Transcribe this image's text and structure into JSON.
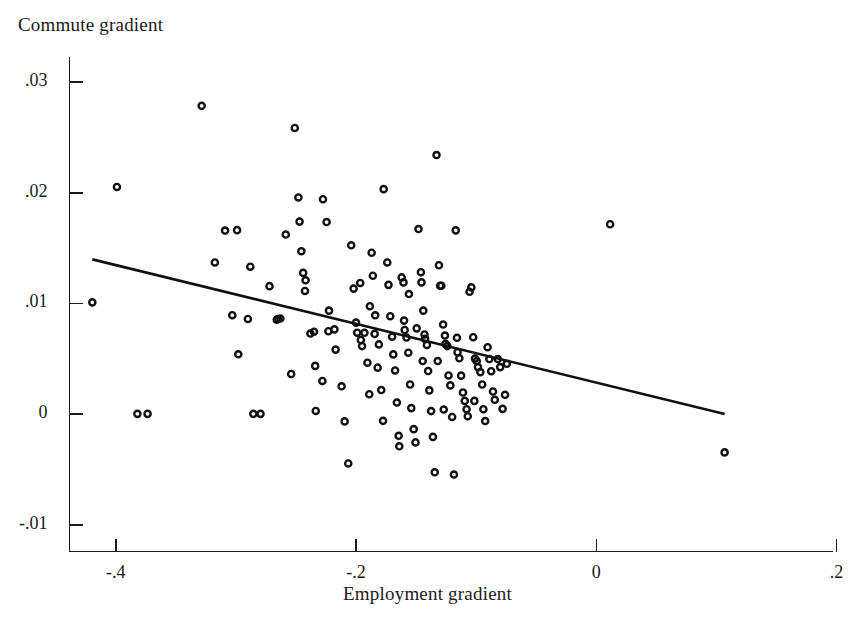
{
  "chart_data": {
    "type": "scatter",
    "title": "",
    "xlabel": "Employment gradient",
    "ylabel": "Commute gradient",
    "grid": false,
    "legend": null,
    "xlim": [
      -0.4385,
      0.1966
    ],
    "ylim": [
      -0.0124,
      0.0323
    ],
    "xticks": [
      -0.4,
      -0.2,
      0,
      0.2
    ],
    "xtick_labels": [
      "-.4",
      "-.2",
      "0",
      ".2"
    ],
    "yticks": [
      -0.01,
      0,
      0.01,
      0.02,
      0.03
    ],
    "ytick_labels": [
      "-.01",
      "0",
      ".01",
      ".02",
      ".03"
    ],
    "marker": "open-circle",
    "marker_color": "#101010",
    "fit_line": {
      "type": "linear",
      "color": "#101010",
      "x_start": -0.4195,
      "y_start": 0.01398,
      "x_end": 0.1068,
      "y_end": 2e-05
    },
    "points": [
      [
        -0.4195,
        0.0101
      ],
      [
        -0.399,
        0.02052
      ],
      [
        -0.382,
        3e-05
      ],
      [
        -0.3735,
        3e-05
      ],
      [
        -0.3285,
        0.02785
      ],
      [
        -0.3175,
        0.0137
      ],
      [
        -0.309,
        0.01658
      ],
      [
        -0.299,
        0.01662
      ],
      [
        -0.303,
        0.00894
      ],
      [
        -0.298,
        0.00541
      ],
      [
        -0.288,
        0.01332
      ],
      [
        -0.2855,
        3e-05
      ],
      [
        -0.2795,
        3e-05
      ],
      [
        -0.272,
        0.01156
      ],
      [
        -0.266,
        0.00853
      ],
      [
        -0.263,
        0.00864
      ],
      [
        -0.265,
        0.00859
      ],
      [
        -0.2585,
        0.01622
      ],
      [
        -0.254,
        0.00363
      ],
      [
        -0.251,
        0.02585
      ],
      [
        -0.248,
        0.01957
      ],
      [
        -0.247,
        0.01739
      ],
      [
        -0.2455,
        0.01472
      ],
      [
        -0.244,
        0.01276
      ],
      [
        -0.242,
        0.01209
      ],
      [
        -0.2425,
        0.01113
      ],
      [
        -0.238,
        0.00728
      ],
      [
        -0.234,
        0.00436
      ],
      [
        -0.2335,
        0.00029
      ],
      [
        -0.2275,
        0.01941
      ],
      [
        -0.2245,
        0.01735
      ],
      [
        -0.2225,
        0.00935
      ],
      [
        -0.223,
        0.00749
      ],
      [
        -0.218,
        0.00766
      ],
      [
        -0.217,
        0.00583
      ],
      [
        -0.212,
        0.00252
      ],
      [
        -0.2095,
        -0.00065
      ],
      [
        -0.2065,
        -0.00445
      ],
      [
        -0.204,
        0.01525
      ],
      [
        -0.202,
        0.01134
      ],
      [
        -0.2,
        0.00827
      ],
      [
        -0.199,
        0.00736
      ],
      [
        -0.196,
        0.0067
      ],
      [
        -0.195,
        0.00615
      ],
      [
        -0.193,
        0.00735
      ],
      [
        -0.1905,
        0.00465
      ],
      [
        -0.189,
        0.0018
      ],
      [
        -0.187,
        0.01458
      ],
      [
        -0.186,
        0.0125
      ],
      [
        -0.184,
        0.00893
      ],
      [
        -0.1845,
        0.00725
      ],
      [
        -0.181,
        0.0063
      ],
      [
        -0.182,
        0.0042
      ],
      [
        -0.179,
        0.00218
      ],
      [
        -0.1775,
        -0.0006
      ],
      [
        -0.177,
        0.02032
      ],
      [
        -0.174,
        0.0137
      ],
      [
        -0.173,
        0.01168
      ],
      [
        -0.1715,
        0.00885
      ],
      [
        -0.17,
        0.007
      ],
      [
        -0.169,
        0.0054
      ],
      [
        -0.1675,
        0.00395
      ],
      [
        -0.166,
        0.00105
      ],
      [
        -0.1645,
        -0.00195
      ],
      [
        -0.164,
        -0.0029
      ],
      [
        -0.162,
        0.01235
      ],
      [
        -0.1605,
        0.0119
      ],
      [
        -0.16,
        0.00845
      ],
      [
        -0.1595,
        0.0076
      ],
      [
        -0.158,
        0.00692
      ],
      [
        -0.1565,
        0.00555
      ],
      [
        -0.155,
        0.00268
      ],
      [
        -0.154,
        0.00055
      ],
      [
        -0.152,
        -0.00135
      ],
      [
        -0.1505,
        -0.00255
      ],
      [
        -0.148,
        0.01672
      ],
      [
        -0.146,
        0.01282
      ],
      [
        -0.1455,
        0.0119
      ],
      [
        -0.144,
        0.00935
      ],
      [
        -0.143,
        0.0072
      ],
      [
        -0.1425,
        0.0068
      ],
      [
        -0.141,
        0.00625
      ],
      [
        -0.14,
        0.0039
      ],
      [
        -0.139,
        0.00215
      ],
      [
        -0.1375,
        0.00028
      ],
      [
        -0.136,
        -0.00205
      ],
      [
        -0.1345,
        -0.00525
      ],
      [
        -0.133,
        0.0234
      ],
      [
        -0.131,
        0.01345
      ],
      [
        -0.13,
        0.0116
      ],
      [
        -0.129,
        0.0116
      ],
      [
        -0.1275,
        0.0081
      ],
      [
        -0.126,
        0.0071
      ],
      [
        -0.1255,
        0.00635
      ],
      [
        -0.124,
        0.00615
      ],
      [
        -0.123,
        0.0035
      ],
      [
        -0.1215,
        0.0026
      ],
      [
        -0.12,
        -0.00025
      ],
      [
        -0.1185,
        -0.00545
      ],
      [
        -0.117,
        0.0166
      ],
      [
        -0.1155,
        0.0056
      ],
      [
        -0.114,
        0.00505
      ],
      [
        -0.1125,
        0.00348
      ],
      [
        -0.111,
        0.00196
      ],
      [
        -0.1095,
        0.0012
      ],
      [
        -0.108,
        0.00045
      ],
      [
        -0.107,
        -0.00018
      ],
      [
        -0.1055,
        0.01105
      ],
      [
        -0.104,
        0.01145
      ],
      [
        -0.1025,
        0.00695
      ],
      [
        -0.101,
        0.00502
      ],
      [
        -0.0995,
        0.0048
      ],
      [
        -0.0985,
        0.00425
      ],
      [
        -0.0965,
        0.0038
      ],
      [
        -0.095,
        0.00268
      ],
      [
        -0.094,
        0.00045
      ],
      [
        -0.0925,
        -0.00062
      ],
      [
        -0.0905,
        0.00605
      ],
      [
        -0.089,
        0.00498
      ],
      [
        -0.0875,
        0.00388
      ],
      [
        -0.086,
        0.00205
      ],
      [
        -0.0845,
        0.0013
      ],
      [
        -0.082,
        0.00498
      ],
      [
        -0.08,
        0.00425
      ],
      [
        -0.078,
        0.00048
      ],
      [
        -0.076,
        0.00175
      ],
      [
        -0.0745,
        0.00455
      ],
      [
        -0.29,
        0.0086
      ],
      [
        -0.235,
        0.00745
      ],
      [
        -0.228,
        0.003
      ],
      [
        -0.1965,
        0.01185
      ],
      [
        -0.1885,
        0.00975
      ],
      [
        -0.156,
        0.01085
      ],
      [
        -0.1495,
        0.00775
      ],
      [
        -0.1445,
        0.0048
      ],
      [
        -0.132,
        0.0048
      ],
      [
        -0.127,
        0.00042
      ],
      [
        -0.116,
        0.0069
      ],
      [
        -0.1015,
        0.0012
      ],
      [
        0.0115,
        0.01715
      ],
      [
        0.1068,
        -0.00345
      ]
    ]
  }
}
